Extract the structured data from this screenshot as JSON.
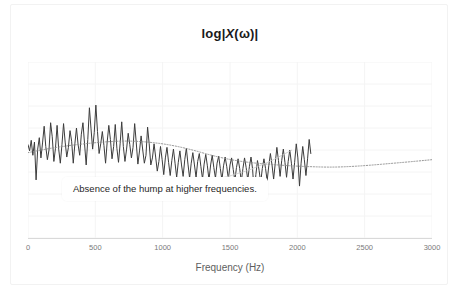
{
  "chart_data": {
    "type": "line",
    "title": "log|X(ω)|",
    "title_parts": {
      "prefix": "log|",
      "variable": "X",
      "suffix": "(ω)|"
    },
    "xlabel": "Frequency (Hz)",
    "ylabel": "",
    "xlim": [
      0,
      3000
    ],
    "ylim": [
      0,
      10
    ],
    "xticks": [
      0,
      500,
      1000,
      1500,
      2000,
      2500,
      3000
    ],
    "xtick_labels": [
      "0",
      "500",
      "1000",
      "1500",
      "2000",
      "2500",
      "3000"
    ],
    "yticks": [],
    "ytick_labels": [],
    "grid": true,
    "grid_color": "#f4f4f4",
    "legend": "none",
    "series": [
      {
        "name": "log-magnitude-spectrum",
        "color": "#3c3c3c",
        "style": "solid",
        "width": 1.0,
        "x_step": 12,
        "values": [
          5.3,
          4.95,
          5.55,
          4.7,
          5.45,
          3.3,
          5.05,
          5.7,
          4.55,
          5.4,
          6.35,
          5.2,
          4.45,
          5.0,
          6.55,
          5.75,
          4.35,
          5.1,
          6.4,
          5.05,
          4.25,
          5.3,
          6.5,
          5.45,
          4.6,
          5.15,
          6.1,
          5.5,
          4.25,
          5.35,
          6.25,
          5.3,
          4.7,
          5.9,
          6.55,
          5.35,
          4.15,
          5.6,
          7.4,
          6.2,
          5.05,
          6.0,
          7.55,
          6.05,
          4.8,
          5.35,
          6.05,
          5.25,
          4.25,
          5.45,
          6.4,
          5.6,
          4.5,
          5.2,
          6.45,
          5.1,
          4.3,
          5.35,
          6.6,
          5.2,
          4.35,
          5.05,
          5.95,
          5.3,
          4.55,
          5.15,
          6.5,
          5.4,
          4.2,
          4.95,
          5.8,
          5.0,
          4.25,
          4.7,
          6.3,
          5.35,
          4.15,
          4.55,
          5.35,
          4.6,
          3.8,
          4.35,
          5.2,
          4.45,
          3.6,
          4.55,
          5.15,
          4.3,
          3.55,
          4.4,
          5.05,
          4.25,
          3.45,
          4.3,
          4.95,
          4.15,
          3.5,
          4.45,
          5.1,
          4.2,
          3.4,
          4.25,
          4.85,
          4.15,
          3.45,
          4.35,
          4.8,
          4.05,
          3.35,
          4.2,
          4.75,
          4.1,
          3.3,
          4.15,
          4.7,
          4.0,
          3.4,
          4.25,
          4.65,
          3.95,
          3.3,
          4.1,
          4.6,
          4.05,
          3.35,
          4.15,
          4.55,
          3.9,
          3.25,
          4.0,
          4.5,
          3.95,
          3.2,
          3.95,
          4.55,
          4.0,
          3.3,
          4.05,
          4.6,
          3.9,
          2.45,
          3.6,
          4.4,
          3.85,
          3.15,
          3.95,
          4.5,
          3.95,
          3.25,
          4.1,
          4.8,
          4.15,
          3.35,
          4.25,
          5.15,
          4.4,
          3.5,
          4.4,
          5.05,
          4.3,
          3.45,
          4.35,
          5.0,
          4.25,
          3.35,
          4.3,
          5.35,
          4.55,
          2.95,
          4.25,
          5.2,
          4.45,
          3.55,
          4.5,
          5.6,
          4.8
        ]
      },
      {
        "name": "spectral-envelope-trend",
        "color": "#8a8a8a",
        "style": "dotted",
        "width": 0.9,
        "x": [
          0,
          150,
          300,
          450,
          600,
          750,
          900,
          1050,
          1200,
          1350,
          1500,
          1650,
          1800,
          1950,
          2100,
          2250,
          2400,
          2550,
          2700,
          2850,
          3000
        ],
        "values": [
          4.85,
          5.08,
          5.25,
          5.38,
          5.48,
          5.52,
          5.45,
          5.3,
          5.05,
          4.72,
          4.45,
          4.28,
          4.18,
          4.1,
          4.05,
          4.02,
          4.06,
          4.14,
          4.24,
          4.34,
          4.45
        ]
      }
    ],
    "annotations": [
      {
        "name": "absence-of-hump",
        "text": "Absence of the hump at higher frequencies.",
        "box_xy": [
          62,
          177
        ],
        "leader_from": [
          205,
          181
        ],
        "leader_to": [
          292,
          150
        ]
      }
    ]
  }
}
